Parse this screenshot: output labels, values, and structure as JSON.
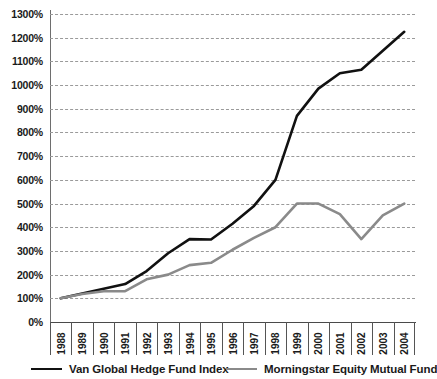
{
  "chart_data": {
    "type": "line",
    "title": "",
    "xlabel": "",
    "ylabel": "",
    "ylim": [
      0,
      1300
    ],
    "ytick_step": 100,
    "grid": true,
    "legend_position": "bottom",
    "categories": [
      "1988",
      "1989",
      "1990",
      "1991",
      "1992",
      "1993",
      "1994",
      "1995",
      "1996",
      "1997",
      "1998",
      "1999",
      "2000",
      "2001",
      "2002",
      "2003",
      "2004"
    ],
    "y_tick_labels": [
      "1300%",
      "1200%",
      "1100%",
      "1000%",
      "900%",
      "800%",
      "700%",
      "600%",
      "500%",
      "400%",
      "300%",
      "200%",
      "100%",
      "0%"
    ],
    "y_tick_values": [
      1300,
      1200,
      1100,
      1000,
      900,
      800,
      700,
      600,
      500,
      400,
      300,
      200,
      100,
      0
    ],
    "series": [
      {
        "name": "Van Global Hedge Fund Index",
        "color": "#111111",
        "values": [
          100,
          120,
          140,
          160,
          215,
          290,
          350,
          348,
          415,
          490,
          600,
          870,
          985,
          1050,
          1065,
          1145,
          1225
        ]
      },
      {
        "name": "Morningstar Equity Mutual Fund",
        "color": "#8a8a8a",
        "values": [
          100,
          118,
          130,
          130,
          180,
          200,
          240,
          250,
          305,
          355,
          400,
          500,
          500,
          455,
          350,
          450,
          500
        ]
      }
    ]
  },
  "legend": {
    "entries": [
      {
        "label": "Van Global Hedge Fund Index",
        "color": "#111111"
      },
      {
        "label": "Morningstar Equity Mutual Fund",
        "color": "#8a8a8a"
      }
    ]
  }
}
